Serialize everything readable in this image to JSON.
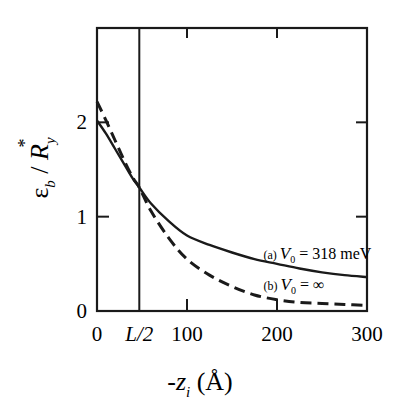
{
  "chart_data": {
    "type": "line",
    "title": "",
    "xlabel": "-z_i (Å)",
    "ylabel": "ε_b / R_y*",
    "xlim": [
      0,
      300
    ],
    "ylim": [
      0,
      3
    ],
    "grid": false,
    "legend_position": "inline annotations",
    "x_ticks": [
      {
        "value": 0,
        "label": "0"
      },
      {
        "value": 47,
        "label": "L/2"
      },
      {
        "value": 100,
        "label": "100"
      },
      {
        "value": 200,
        "label": "200"
      },
      {
        "value": 300,
        "label": "300"
      }
    ],
    "y_ticks": [
      {
        "value": 0,
        "label": "0"
      },
      {
        "value": 1,
        "label": "1"
      },
      {
        "value": 2,
        "label": "2"
      }
    ],
    "vertical_line": {
      "x": 47,
      "label": "L/2"
    },
    "series": [
      {
        "name": "(a) V0 = 318 meV",
        "style": "solid",
        "x": [
          0,
          10,
          20,
          30,
          40,
          47,
          60,
          80,
          100,
          125,
          150,
          175,
          200,
          225,
          250,
          275,
          300
        ],
        "y": [
          2.02,
          1.88,
          1.72,
          1.56,
          1.4,
          1.31,
          1.14,
          0.95,
          0.8,
          0.7,
          0.62,
          0.55,
          0.5,
          0.45,
          0.41,
          0.38,
          0.36
        ]
      },
      {
        "name": "(b) V0 = ∞",
        "style": "dashed",
        "x": [
          0,
          10,
          20,
          30,
          40,
          47,
          60,
          80,
          100,
          125,
          150,
          175,
          200,
          225,
          250,
          275,
          300
        ],
        "y": [
          2.22,
          2.02,
          1.81,
          1.6,
          1.41,
          1.31,
          1.06,
          0.77,
          0.55,
          0.38,
          0.26,
          0.17,
          0.12,
          0.09,
          0.08,
          0.07,
          0.06
        ]
      }
    ],
    "annotations": [
      {
        "series": 0,
        "prefix": "(a) ",
        "var": "V",
        "sub": "0",
        "text": " = 318 meV",
        "x": 185,
        "y": 0.55
      },
      {
        "series": 1,
        "prefix": "(b) ",
        "var": "V",
        "sub": "0",
        "text": " = ∞",
        "x": 185,
        "y": 0.22
      }
    ]
  },
  "axis_labels": {
    "x_main": "-z",
    "x_sub": "i",
    "x_unit": " (Å)",
    "y_eps": "ε",
    "y_sub": "b",
    "y_sep": " / ",
    "y_R": "R",
    "y_Rsub": "y",
    "y_star": "*"
  }
}
